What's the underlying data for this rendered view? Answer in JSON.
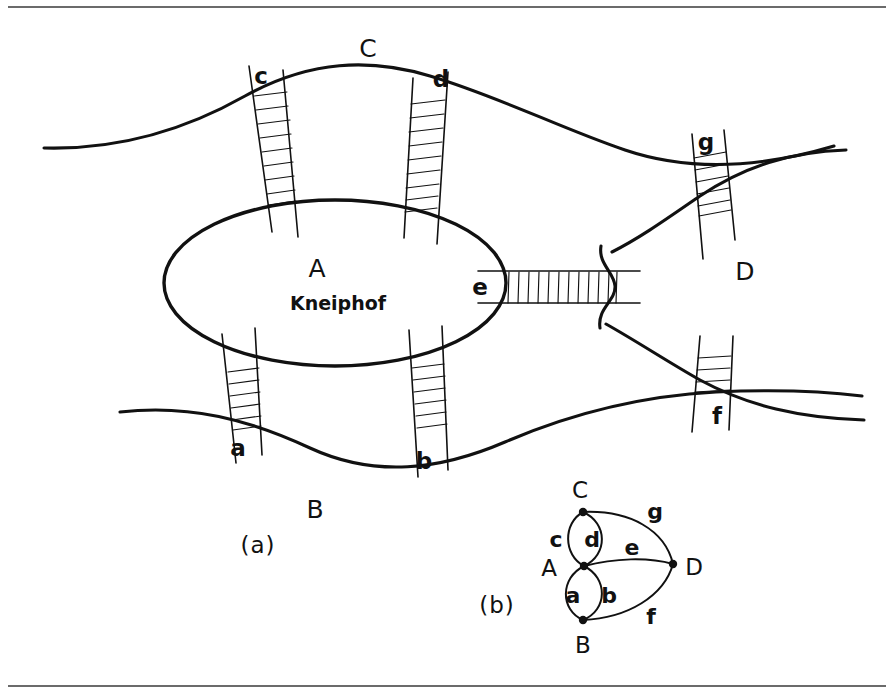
{
  "figure": {
    "title_alt": "The bridges of Königsberg and its multigraph model",
    "panels": [
      {
        "key": "map",
        "caption": "(a)",
        "caption_x": 258,
        "caption_y": 545
      },
      {
        "key": "graph",
        "caption": "(b)",
        "caption_x": 497,
        "caption_y": 605
      }
    ]
  },
  "map": {
    "island_label": "A",
    "island_name": "Kneiphof",
    "island_label_x": 317,
    "island_label_y": 268,
    "island_name_x": 338,
    "island_name_y": 303,
    "regions": [
      {
        "id": "A",
        "label": "A",
        "x": 317,
        "y": 268
      },
      {
        "id": "B",
        "label": "B",
        "x": 315,
        "y": 509
      },
      {
        "id": "C",
        "label": "C",
        "x": 368,
        "y": 48
      },
      {
        "id": "D",
        "label": "D",
        "x": 745,
        "y": 271
      }
    ],
    "bridges": [
      {
        "id": "c",
        "label": "c",
        "x": 261,
        "y": 76,
        "connects": [
          "A",
          "C"
        ]
      },
      {
        "id": "d",
        "label": "d",
        "x": 441,
        "y": 79,
        "connects": [
          "A",
          "C"
        ]
      },
      {
        "id": "g",
        "label": "g",
        "x": 706,
        "y": 142,
        "connects": [
          "C",
          "D"
        ]
      },
      {
        "id": "e",
        "label": "e",
        "x": 480,
        "y": 287,
        "connects": [
          "A",
          "D"
        ]
      },
      {
        "id": "a",
        "label": "a",
        "x": 238,
        "y": 448,
        "connects": [
          "A",
          "B"
        ]
      },
      {
        "id": "b",
        "label": "b",
        "x": 424,
        "y": 461,
        "connects": [
          "A",
          "B"
        ]
      },
      {
        "id": "f",
        "label": "f",
        "x": 717,
        "y": 416,
        "connects": [
          "B",
          "D"
        ]
      }
    ]
  },
  "graph": {
    "nodes": [
      {
        "id": "A",
        "label": "A",
        "cx": 584,
        "cy": 566,
        "label_x": 549,
        "label_y": 568
      },
      {
        "id": "B",
        "label": "B",
        "cx": 583,
        "cy": 620,
        "label_x": 583,
        "label_y": 645
      },
      {
        "id": "C",
        "label": "C",
        "cx": 583,
        "cy": 512,
        "label_x": 580,
        "label_y": 490
      },
      {
        "id": "D",
        "label": "D",
        "cx": 673,
        "cy": 564,
        "label_x": 694,
        "label_y": 567
      }
    ],
    "edges": [
      {
        "id": "c",
        "label": "c",
        "from": "A",
        "to": "C",
        "label_x": 556,
        "label_y": 540
      },
      {
        "id": "d",
        "label": "d",
        "from": "A",
        "to": "C",
        "label_x": 592,
        "label_y": 540
      },
      {
        "id": "a",
        "label": "a",
        "from": "A",
        "to": "B",
        "label_x": 573,
        "label_y": 596
      },
      {
        "id": "b",
        "label": "b",
        "from": "A",
        "to": "B",
        "label_x": 609,
        "label_y": 596
      },
      {
        "id": "e",
        "label": "e",
        "from": "A",
        "to": "D",
        "label_x": 632,
        "label_y": 548
      },
      {
        "id": "g",
        "label": "g",
        "from": "C",
        "to": "D",
        "label_x": 655,
        "label_y": 512
      },
      {
        "id": "f",
        "label": "f",
        "from": "B",
        "to": "D",
        "label_x": 651,
        "label_y": 617
      }
    ]
  },
  "colors": {
    "ink": "#111111",
    "paper": "#ffffff",
    "rule": "#3a3a3a"
  }
}
